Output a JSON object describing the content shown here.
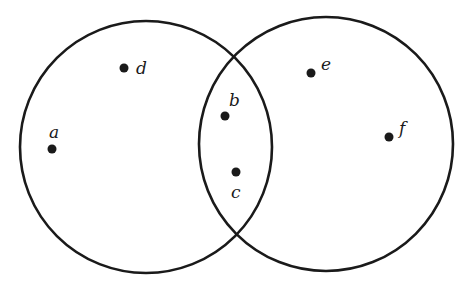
{
  "diagram": {
    "type": "venn",
    "sets": [
      {
        "id": "left",
        "cx": 146,
        "cy": 147,
        "r": 126
      },
      {
        "id": "right",
        "cx": 326,
        "cy": 144,
        "r": 127
      }
    ],
    "points": [
      {
        "label": "a",
        "x": 52,
        "y": 149,
        "lx": 49,
        "ly": 138,
        "region": "left-only"
      },
      {
        "label": "d",
        "x": 124,
        "y": 68,
        "lx": 136,
        "ly": 74,
        "region": "left-only"
      },
      {
        "label": "b",
        "x": 225,
        "y": 116,
        "lx": 229,
        "ly": 106,
        "region": "intersection"
      },
      {
        "label": "c",
        "x": 236,
        "y": 172,
        "lx": 231,
        "ly": 198,
        "region": "intersection"
      },
      {
        "label": "e",
        "x": 311,
        "y": 73,
        "lx": 321,
        "ly": 70,
        "region": "right-only"
      },
      {
        "label": "f",
        "x": 389,
        "y": 137,
        "lx": 399,
        "ly": 134,
        "region": "right-only"
      }
    ]
  }
}
